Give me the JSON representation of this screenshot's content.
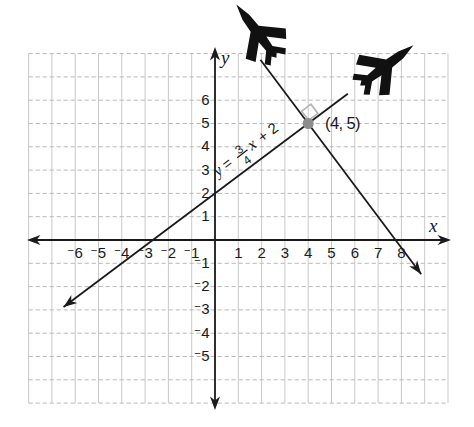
{
  "chart_data": {
    "type": "line",
    "title": "",
    "xlabel": "x",
    "ylabel": "y",
    "xlim": [
      -8,
      10
    ],
    "ylim": [
      -7,
      8
    ],
    "grid": true,
    "x_ticks": [
      -6,
      -5,
      -4,
      -3,
      -2,
      -1,
      1,
      2,
      3,
      4,
      5,
      6,
      7,
      8
    ],
    "y_ticks": [
      6,
      5,
      4,
      3,
      2,
      1,
      -1,
      -2,
      -3,
      -4,
      -5
    ],
    "series": [
      {
        "name": "flight-path-1",
        "equation_label": "y = 3/4 x + 2",
        "slope": 0.75,
        "intercept": 2,
        "x_start": -6.5,
        "x_end": 5.7,
        "arrow_at": "start",
        "plane_at": "end"
      },
      {
        "name": "flight-path-2-perpendicular",
        "equation_label": "",
        "slope": -1.3333,
        "intercept": 10.3333,
        "x_start": 1.95,
        "x_end": 8.85,
        "arrow_at": "end",
        "plane_at": "start"
      }
    ],
    "intersection_point": {
      "x": 4,
      "y": 5,
      "label": "(4, 5)"
    },
    "right_angle_marker_at": [
      4,
      5
    ]
  },
  "labels": {
    "axis_x": "x",
    "axis_y": "y",
    "point": "(4, 5)",
    "equation": {
      "lhs": "y",
      "equals": "=",
      "numerator": "3",
      "denominator": "4",
      "variable": "x",
      "rest": "+ 2"
    }
  },
  "ticks_display": {
    "x_negative": [
      "⁻6",
      "⁻5",
      "⁻4",
      "⁻3",
      "⁻2",
      "⁻1"
    ],
    "x_positive": [
      "1",
      "2",
      "3",
      "4",
      "5",
      "6",
      "7",
      "8"
    ],
    "y_positive": [
      "6",
      "5",
      "4",
      "3",
      "2",
      "1"
    ],
    "y_negative": [
      "⁻1",
      "⁻2",
      "⁻3",
      "⁻4",
      "⁻5"
    ]
  },
  "icons": [
    {
      "name": "airplane-icon",
      "heading_deg": -127
    },
    {
      "name": "airplane-icon",
      "heading_deg": -37
    }
  ],
  "colors": {
    "ink": "#1a1a1a",
    "grid_vertical": "#c9c9c9",
    "grid_horizontal": "#b9b9b9",
    "point_fill": "#8d8d8d",
    "right_angle": "#b3b3b3",
    "background": "#ffffff"
  }
}
